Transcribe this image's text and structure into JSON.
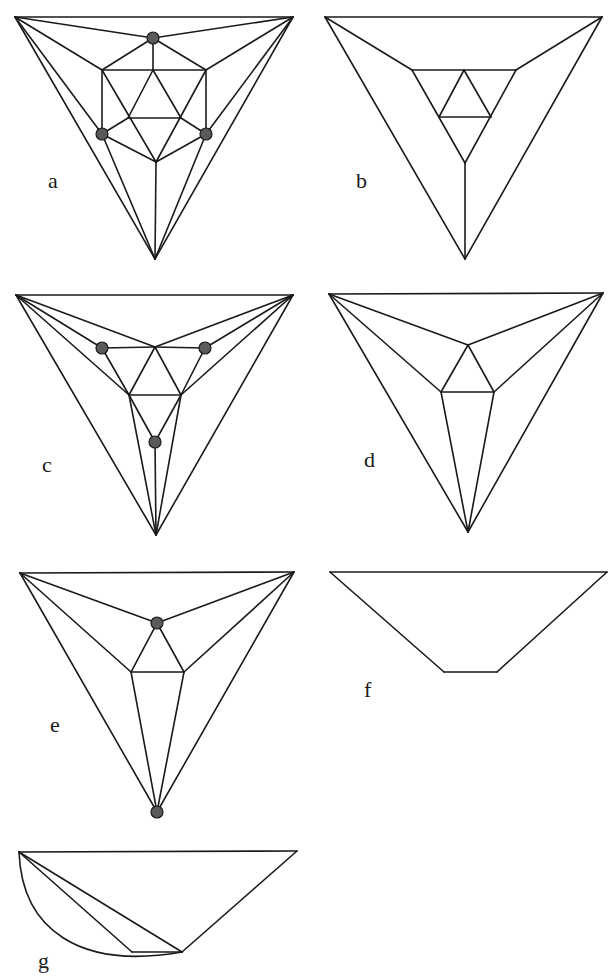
{
  "figure": {
    "panels": [
      {
        "id": "a",
        "label": "a",
        "label_pos": [
          48,
          188
        ],
        "edges": [
          [
            [
              15,
              17
            ],
            [
              293,
              17
            ]
          ],
          [
            [
              15,
              17
            ],
            [
              155,
              259
            ]
          ],
          [
            [
              293,
              17
            ],
            [
              155,
              259
            ]
          ],
          [
            [
              15,
              17
            ],
            [
              153,
              38
            ]
          ],
          [
            [
              293,
              17
            ],
            [
              153,
              38
            ]
          ],
          [
            [
              15,
              17
            ],
            [
              102,
              70
            ]
          ],
          [
            [
              293,
              17
            ],
            [
              206,
              70
            ]
          ],
          [
            [
              15,
              17
            ],
            [
              102,
              134
            ]
          ],
          [
            [
              293,
              17
            ],
            [
              206,
              134
            ]
          ],
          [
            [
              153,
              38
            ],
            [
              102,
              70
            ]
          ],
          [
            [
              153,
              38
            ],
            [
              206,
              70
            ]
          ],
          [
            [
              153,
              38
            ],
            [
              153,
              70
            ]
          ],
          [
            [
              102,
              70
            ],
            [
              206,
              70
            ]
          ],
          [
            [
              102,
              70
            ],
            [
              102,
              134
            ]
          ],
          [
            [
              206,
              70
            ],
            [
              206,
              134
            ]
          ],
          [
            [
              153,
              70
            ],
            [
              128,
              118
            ]
          ],
          [
            [
              153,
              70
            ],
            [
              181,
              118
            ]
          ],
          [
            [
              128,
              118
            ],
            [
              181,
              118
            ]
          ],
          [
            [
              102,
              70
            ],
            [
              156,
              162
            ]
          ],
          [
            [
              206,
              70
            ],
            [
              156,
              162
            ]
          ],
          [
            [
              102,
              134
            ],
            [
              128,
              118
            ]
          ],
          [
            [
              206,
              134
            ],
            [
              181,
              118
            ]
          ],
          [
            [
              102,
              134
            ],
            [
              156,
              162
            ]
          ],
          [
            [
              206,
              134
            ],
            [
              156,
              162
            ]
          ],
          [
            [
              156,
              162
            ],
            [
              155,
              259
            ]
          ],
          [
            [
              102,
              134
            ],
            [
              155,
              259
            ]
          ],
          [
            [
              206,
              134
            ],
            [
              155,
              259
            ]
          ]
        ],
        "nodes": [
          [
            153,
            38
          ],
          [
            102,
            134
          ],
          [
            206,
            134
          ]
        ]
      },
      {
        "id": "b",
        "label": "b",
        "label_pos": [
          356,
          188
        ],
        "edges": [
          [
            [
              325,
              17
            ],
            [
              602,
              17
            ]
          ],
          [
            [
              325,
              17
            ],
            [
              465,
              259
            ]
          ],
          [
            [
              602,
              17
            ],
            [
              465,
              259
            ]
          ],
          [
            [
              325,
              17
            ],
            [
              412,
              70
            ]
          ],
          [
            [
              602,
              17
            ],
            [
              516,
              70
            ]
          ],
          [
            [
              412,
              70
            ],
            [
              516,
              70
            ]
          ],
          [
            [
              412,
              70
            ],
            [
              465,
              163
            ]
          ],
          [
            [
              516,
              70
            ],
            [
              465,
              163
            ]
          ],
          [
            [
              464,
              70
            ],
            [
              439,
              117
            ]
          ],
          [
            [
              464,
              70
            ],
            [
              491,
              117
            ]
          ],
          [
            [
              439,
              117
            ],
            [
              491,
              117
            ]
          ],
          [
            [
              465,
              163
            ],
            [
              465,
              259
            ]
          ]
        ],
        "nodes": []
      },
      {
        "id": "c",
        "label": "c",
        "label_pos": [
          42,
          472
        ],
        "edges": [
          [
            [
              16,
              295
            ],
            [
              293,
              295
            ]
          ],
          [
            [
              16,
              295
            ],
            [
              156,
              535
            ]
          ],
          [
            [
              293,
              295
            ],
            [
              156,
              535
            ]
          ],
          [
            [
              16,
              295
            ],
            [
              155,
              347
            ]
          ],
          [
            [
              293,
              295
            ],
            [
              155,
              347
            ]
          ],
          [
            [
              16,
              295
            ],
            [
              102,
              348
            ]
          ],
          [
            [
              293,
              295
            ],
            [
              205,
              348
            ]
          ],
          [
            [
              16,
              295
            ],
            [
              129,
              395
            ]
          ],
          [
            [
              293,
              295
            ],
            [
              181,
              395
            ]
          ],
          [
            [
              102,
              348
            ],
            [
              155,
              347
            ]
          ],
          [
            [
              205,
              348
            ],
            [
              155,
              347
            ]
          ],
          [
            [
              102,
              348
            ],
            [
              129,
              395
            ]
          ],
          [
            [
              205,
              348
            ],
            [
              181,
              395
            ]
          ],
          [
            [
              155,
              347
            ],
            [
              129,
              395
            ]
          ],
          [
            [
              155,
              347
            ],
            [
              181,
              395
            ]
          ],
          [
            [
              129,
              395
            ],
            [
              181,
              395
            ]
          ],
          [
            [
              129,
              395
            ],
            [
              155,
              442
            ]
          ],
          [
            [
              181,
              395
            ],
            [
              155,
              442
            ]
          ],
          [
            [
              129,
              395
            ],
            [
              156,
              535
            ]
          ],
          [
            [
              181,
              395
            ],
            [
              156,
              535
            ]
          ],
          [
            [
              155,
              442
            ],
            [
              156,
              535
            ]
          ]
        ],
        "nodes": [
          [
            102,
            348
          ],
          [
            205,
            348
          ],
          [
            155,
            442
          ]
        ]
      },
      {
        "id": "d",
        "label": "d",
        "label_pos": [
          364,
          467
        ],
        "edges": [
          [
            [
              329,
              294
            ],
            [
              603,
              293
            ]
          ],
          [
            [
              329,
              294
            ],
            [
              468,
              532
            ]
          ],
          [
            [
              603,
              293
            ],
            [
              468,
              532
            ]
          ],
          [
            [
              329,
              294
            ],
            [
              468,
              345
            ]
          ],
          [
            [
              603,
              293
            ],
            [
              468,
              345
            ]
          ],
          [
            [
              329,
              294
            ],
            [
              441,
              392
            ]
          ],
          [
            [
              603,
              293
            ],
            [
              494,
              392
            ]
          ],
          [
            [
              468,
              345
            ],
            [
              441,
              392
            ]
          ],
          [
            [
              468,
              345
            ],
            [
              494,
              392
            ]
          ],
          [
            [
              441,
              392
            ],
            [
              494,
              392
            ]
          ],
          [
            [
              441,
              392
            ],
            [
              468,
              532
            ]
          ],
          [
            [
              494,
              392
            ],
            [
              468,
              532
            ]
          ]
        ],
        "nodes": []
      },
      {
        "id": "e",
        "label": "e",
        "label_pos": [
          50,
          732
        ],
        "edges": [
          [
            [
              20,
              573
            ],
            [
              294,
              572
            ]
          ],
          [
            [
              20,
              573
            ],
            [
              157,
              812
            ]
          ],
          [
            [
              294,
              572
            ],
            [
              157,
              812
            ]
          ],
          [
            [
              20,
              573
            ],
            [
              157,
              623
            ]
          ],
          [
            [
              294,
              572
            ],
            [
              157,
              623
            ]
          ],
          [
            [
              20,
              573
            ],
            [
              131,
              672
            ]
          ],
          [
            [
              294,
              572
            ],
            [
              184,
              672
            ]
          ],
          [
            [
              157,
              623
            ],
            [
              131,
              672
            ]
          ],
          [
            [
              157,
              623
            ],
            [
              184,
              672
            ]
          ],
          [
            [
              131,
              672
            ],
            [
              184,
              672
            ]
          ],
          [
            [
              131,
              672
            ],
            [
              157,
              812
            ]
          ],
          [
            [
              184,
              672
            ],
            [
              157,
              812
            ]
          ]
        ],
        "nodes": [
          [
            157,
            623
          ],
          [
            157,
            812
          ]
        ]
      },
      {
        "id": "f",
        "label": "f",
        "label_pos": [
          364,
          697
        ],
        "edges": [
          [
            [
              330,
              572
            ],
            [
              607,
              572
            ]
          ],
          [
            [
              330,
              572
            ],
            [
              444,
              672
            ]
          ],
          [
            [
              607,
              572
            ],
            [
              497,
              672
            ]
          ],
          [
            [
              444,
              672
            ],
            [
              497,
              672
            ]
          ]
        ],
        "nodes": []
      },
      {
        "id": "g",
        "label": "g",
        "label_pos": [
          38,
          968
        ],
        "edges": [
          [
            [
              19,
              852
            ],
            [
              297,
              851
            ]
          ],
          [
            [
              297,
              851
            ],
            [
              182,
              952
            ]
          ],
          [
            [
              19,
              852
            ],
            [
              182,
              952
            ]
          ],
          [
            [
              19,
              852
            ],
            [
              132,
              952
            ]
          ],
          [
            [
              132,
              952
            ],
            [
              182,
              952
            ]
          ]
        ],
        "curves": [
          "M19,852 C22,930 80,970 182,952"
        ],
        "nodes": []
      }
    ]
  }
}
